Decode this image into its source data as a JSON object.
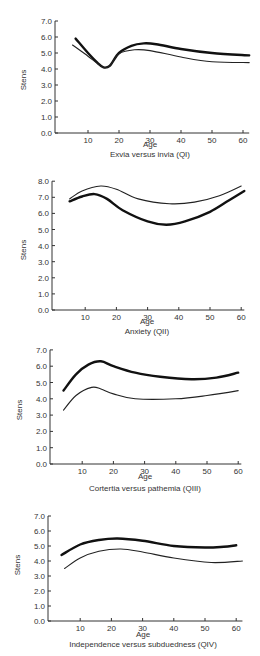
{
  "chart_data": [
    {
      "type": "line",
      "title": "Exvia versus invia (QI)",
      "xlabel": "Age",
      "ylabel": "Stens",
      "xticks": [
        10,
        20,
        30,
        40,
        50,
        60
      ],
      "yticks": [
        "0.0",
        "1.0",
        "2.0",
        "3.0",
        "4.0",
        "5.0",
        "6.0",
        "7.0"
      ],
      "xlim": [
        0,
        62
      ],
      "ylim": [
        0,
        7
      ],
      "grid": false,
      "series": [
        {
          "name": "thick",
          "style": "thick",
          "points": [
            [
              6,
              5.9
            ],
            [
              10,
              5.0
            ],
            [
              13,
              4.4
            ],
            [
              15,
              4.1
            ],
            [
              17,
              4.2
            ],
            [
              20,
              5.0
            ],
            [
              24,
              5.45
            ],
            [
              28,
              5.6
            ],
            [
              32,
              5.55
            ],
            [
              40,
              5.25
            ],
            [
              50,
              5.0
            ],
            [
              62,
              4.85
            ]
          ]
        },
        {
          "name": "thin",
          "style": "thin",
          "points": [
            [
              5,
              5.5
            ],
            [
              10,
              4.8
            ],
            [
              13,
              4.35
            ],
            [
              15,
              4.1
            ],
            [
              17,
              4.2
            ],
            [
              20,
              4.95
            ],
            [
              25,
              5.2
            ],
            [
              30,
              5.15
            ],
            [
              40,
              4.75
            ],
            [
              50,
              4.45
            ],
            [
              62,
              4.4
            ]
          ]
        }
      ],
      "layout": {
        "top": 0,
        "height": 165,
        "axis_x": 55,
        "x0": 57,
        "px_per_year": 3.1,
        "y_zero": 133,
        "px_per_unit": 16,
        "age_label_y": 146,
        "caption_y": 157
      }
    },
    {
      "type": "line",
      "title": "Anxiety (QII)",
      "xlabel": "Age",
      "ylabel": "Stens",
      "xticks": [
        10,
        20,
        30,
        40,
        50,
        60
      ],
      "yticks": [
        "0.0",
        "1.0",
        "2.0",
        "3.0",
        "4.0",
        "5.0",
        "6.0",
        "7.0",
        "8.0"
      ],
      "xlim": [
        0,
        61
      ],
      "ylim": [
        0,
        8
      ],
      "grid": false,
      "series": [
        {
          "name": "thin",
          "style": "thin",
          "points": [
            [
              5,
              6.9
            ],
            [
              9,
              7.4
            ],
            [
              15,
              7.7
            ],
            [
              20,
              7.5
            ],
            [
              27,
              6.9
            ],
            [
              37,
              6.6
            ],
            [
              45,
              6.7
            ],
            [
              53,
              7.1
            ],
            [
              60,
              7.7
            ]
          ]
        },
        {
          "name": "thick",
          "style": "thick",
          "points": [
            [
              5,
              6.75
            ],
            [
              9,
              7.05
            ],
            [
              13,
              7.2
            ],
            [
              17,
              6.9
            ],
            [
              22,
              6.2
            ],
            [
              30,
              5.5
            ],
            [
              36,
              5.3
            ],
            [
              42,
              5.5
            ],
            [
              50,
              6.1
            ],
            [
              56,
              6.8
            ],
            [
              61,
              7.4
            ]
          ]
        }
      ],
      "layout": {
        "top": 165,
        "height": 170,
        "axis_x": 52,
        "x0": 54,
        "px_per_year": 3.12,
        "y_zero": 310,
        "px_per_unit": 16.1,
        "age_label_y": 324,
        "caption_y": 334
      }
    },
    {
      "type": "line",
      "title": "Cortertia versus pathemia (QIII)",
      "xlabel": "Age",
      "ylabel": "Stens",
      "xticks": [
        10,
        20,
        30,
        40,
        50,
        60
      ],
      "yticks": [
        "0.0",
        "1.0",
        "2.0",
        "3.0",
        "4.0",
        "5.0",
        "6.0",
        "7.0"
      ],
      "xlim": [
        0,
        61
      ],
      "ylim": [
        0,
        7
      ],
      "grid": false,
      "series": [
        {
          "name": "thick",
          "style": "thick",
          "points": [
            [
              4,
              4.5
            ],
            [
              8,
              5.5
            ],
            [
              12,
              6.1
            ],
            [
              16,
              6.3
            ],
            [
              20,
              6.0
            ],
            [
              27,
              5.6
            ],
            [
              35,
              5.35
            ],
            [
              45,
              5.2
            ],
            [
              53,
              5.3
            ],
            [
              60,
              5.6
            ]
          ]
        },
        {
          "name": "thin",
          "style": "thin",
          "points": [
            [
              4,
              3.3
            ],
            [
              8,
              4.2
            ],
            [
              13,
              4.7
            ],
            [
              16,
              4.6
            ],
            [
              20,
              4.3
            ],
            [
              27,
              4.0
            ],
            [
              40,
              4.0
            ],
            [
              50,
              4.2
            ],
            [
              60,
              4.5
            ]
          ]
        }
      ],
      "layout": {
        "top": 335,
        "height": 165,
        "axis_x": 50,
        "x0": 51,
        "px_per_year": 3.12,
        "y_zero": 464,
        "px_per_unit": 16.3,
        "age_label_y": 478,
        "caption_y": 490
      }
    },
    {
      "type": "line",
      "title": "Independence versus subduedness (QIV)",
      "xlabel": "Age",
      "ylabel": "Stens",
      "xticks": [
        10,
        20,
        30,
        40,
        50,
        60
      ],
      "yticks": [
        "0.0",
        "1.0",
        "2.0",
        "3.0",
        "4.0",
        "5.0",
        "6.0",
        "7.0"
      ],
      "xlim": [
        0,
        62
      ],
      "ylim": [
        0,
        7
      ],
      "grid": false,
      "series": [
        {
          "name": "thick",
          "style": "thick",
          "points": [
            [
              4,
              4.4
            ],
            [
              10,
              5.1
            ],
            [
              16,
              5.4
            ],
            [
              22,
              5.5
            ],
            [
              30,
              5.35
            ],
            [
              40,
              5.0
            ],
            [
              50,
              4.9
            ],
            [
              56,
              4.95
            ],
            [
              60,
              5.05
            ]
          ]
        },
        {
          "name": "thin",
          "style": "thin",
          "points": [
            [
              5,
              3.5
            ],
            [
              10,
              4.2
            ],
            [
              16,
              4.65
            ],
            [
              23,
              4.8
            ],
            [
              30,
              4.6
            ],
            [
              40,
              4.2
            ],
            [
              52,
              3.9
            ],
            [
              62,
              4.0
            ]
          ]
        }
      ],
      "layout": {
        "top": 500,
        "height": 156,
        "axis_x": 48,
        "x0": 49,
        "px_per_year": 3.12,
        "y_zero": 621,
        "px_per_unit": 15.0,
        "age_label_y": 635,
        "caption_y": 646
      }
    }
  ]
}
